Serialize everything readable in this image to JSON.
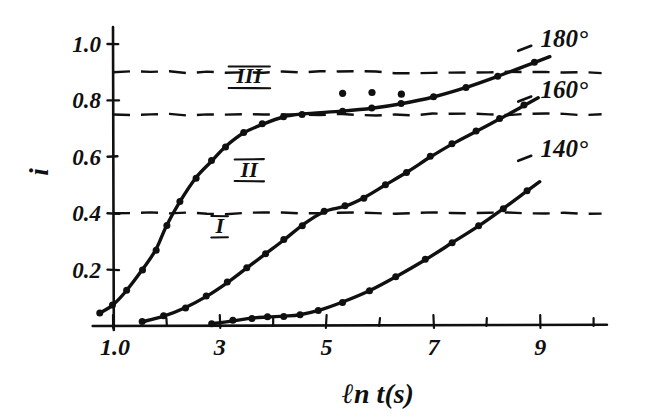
{
  "chart_data": {
    "type": "line",
    "title": "",
    "subtitle": "",
    "xlabel": "ℓn t(s)",
    "ylabel": "i",
    "xlim": [
      0.5,
      10.3
    ],
    "ylim": [
      0.0,
      1.08
    ],
    "grid": false,
    "legend_position": "right-inline",
    "xticks": [
      1.0,
      2,
      3,
      4,
      5,
      6,
      7,
      8,
      9,
      10
    ],
    "xtick_labels": [
      "1.0",
      "",
      "3",
      "",
      "5",
      "",
      "7",
      "",
      "9",
      ""
    ],
    "yticks": [
      0.2,
      0.4,
      0.6,
      0.8,
      1.0
    ],
    "ytick_labels": [
      "0.2",
      "0.4",
      "0.6",
      "0.8",
      "1.0"
    ],
    "annotations": [
      {
        "name": "curve-label-I",
        "text": "I",
        "x": 3.0,
        "y": 0.33
      },
      {
        "name": "curve-label-II",
        "text": "II",
        "x": 3.55,
        "y": 0.53
      },
      {
        "name": "curve-label-III",
        "text": "III",
        "x": 3.55,
        "y": 0.86
      },
      {
        "name": "series-label-180",
        "text": "180°",
        "x": 9.45,
        "y": 0.99
      },
      {
        "name": "series-label-160",
        "text": "160°",
        "x": 9.45,
        "y": 0.81
      },
      {
        "name": "series-label-140",
        "text": "140°",
        "x": 9.45,
        "y": 0.6
      }
    ],
    "reference_lines": [
      {
        "name": "dashed-line-0.90",
        "axis": "y",
        "value": 0.9,
        "style": "dashed"
      },
      {
        "name": "dashed-line-0.75",
        "axis": "y",
        "value": 0.75,
        "style": "dashed"
      },
      {
        "name": "dashed-line-0.40",
        "axis": "y",
        "value": 0.4,
        "style": "dashed"
      }
    ],
    "series": [
      {
        "name": "180°",
        "curve_label": "III",
        "marker": "filled-circle",
        "x": [
          0.75,
          1.0,
          1.25,
          1.55,
          1.8,
          2.0,
          2.25,
          2.55,
          2.85,
          3.1,
          3.45,
          3.8,
          4.2,
          4.55,
          5.3,
          5.85,
          6.4,
          7.0,
          7.6,
          8.2,
          8.9
        ],
        "y": [
          0.045,
          0.075,
          0.125,
          0.2,
          0.27,
          0.355,
          0.44,
          0.525,
          0.585,
          0.635,
          0.685,
          0.715,
          0.742,
          0.752,
          0.762,
          0.772,
          0.788,
          0.812,
          0.845,
          0.885,
          0.935
        ],
        "extra_points_x": [
          5.3,
          5.85,
          6.4
        ],
        "extra_points_y": [
          0.825,
          0.828,
          0.822
        ]
      },
      {
        "name": "160°",
        "curve_label": "II",
        "marker": "filled-circle",
        "x": [
          1.55,
          1.95,
          2.35,
          2.75,
          3.15,
          3.5,
          3.85,
          4.2,
          4.55,
          4.95,
          5.35,
          5.7,
          6.1,
          6.5,
          6.95,
          7.35,
          7.8,
          8.25,
          8.7
        ],
        "y": [
          0.015,
          0.035,
          0.065,
          0.105,
          0.155,
          0.205,
          0.255,
          0.305,
          0.358,
          0.405,
          0.425,
          0.455,
          0.5,
          0.545,
          0.6,
          0.645,
          0.69,
          0.735,
          0.782
        ],
        "extra_points_x": [],
        "extra_points_y": []
      },
      {
        "name": "140°",
        "curve_label": "I",
        "marker": "filled-circle",
        "x": [
          2.85,
          3.25,
          3.6,
          3.9,
          4.2,
          4.5,
          4.85,
          5.3,
          5.8,
          6.3,
          6.85,
          7.35,
          7.85,
          8.3,
          8.75
        ],
        "y": [
          0.008,
          0.018,
          0.028,
          0.032,
          0.035,
          0.04,
          0.055,
          0.085,
          0.125,
          0.175,
          0.235,
          0.295,
          0.355,
          0.415,
          0.478
        ],
        "extra_points_x": [],
        "extra_points_y": []
      }
    ]
  },
  "axes": {
    "y_axis_label": "i",
    "x_axis_label": "ℓn t(s)",
    "x_tick_labels": [
      "1.0",
      "3",
      "5",
      "7",
      "9"
    ],
    "y_tick_labels": [
      "1.0",
      "0.8",
      "0.6",
      "0.4",
      "0.2"
    ]
  },
  "colors": {
    "ink": "#101010",
    "background": "#ffffff"
  }
}
